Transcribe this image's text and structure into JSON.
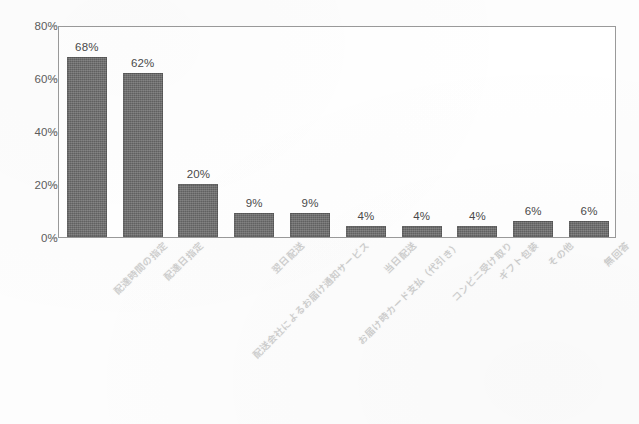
{
  "chart_data": {
    "type": "bar",
    "title": "",
    "subtitle": "",
    "xlabel": "",
    "ylabel": "",
    "ylim": [
      0,
      80
    ],
    "ytick_values": [
      0,
      20,
      40,
      60,
      80
    ],
    "ytick_labels": [
      "0%",
      "20%",
      "40%",
      "60%",
      "80%"
    ],
    "grid": false,
    "legend": false,
    "legend_position": "none",
    "bar_color": "#6a6a6a",
    "axis_color": "#9a9a9a",
    "label_color": "#5c5c5c",
    "categories": [
      "配達時間の指定",
      "配達日指定",
      "配送会社によるお届け通知サービス",
      "翌日配送",
      "お届け時カード支払（代引き）",
      "当日配送",
      "コンビニ受け取り",
      "ギフト包装",
      "その他",
      "無回答"
    ],
    "values": [
      68,
      62,
      20,
      9,
      9,
      4,
      4,
      4,
      6,
      6
    ],
    "value_labels": [
      "68%",
      "62%",
      "20%",
      "9%",
      "9%",
      "4%",
      "4%",
      "4%",
      "6%",
      "6%"
    ]
  }
}
